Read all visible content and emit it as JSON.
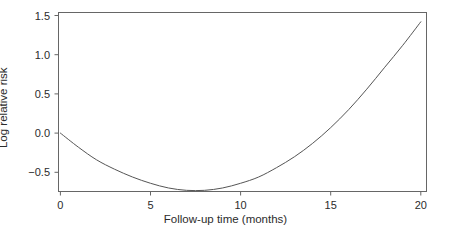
{
  "chart_data": {
    "type": "line",
    "title": "",
    "xlabel": "Follow-up time (months)",
    "ylabel": "Log relative risk",
    "xlim": [
      -0.8,
      21.0
    ],
    "ylim": [
      -0.82,
      1.58
    ],
    "xticks": [
      0,
      5,
      10,
      15,
      20
    ],
    "xtick_labels": [
      "0",
      "5",
      "10",
      "15",
      "20"
    ],
    "yticks": [
      -0.5,
      0.0,
      0.5,
      1.0,
      1.5
    ],
    "ytick_labels": [
      "−0.5",
      "0.0",
      "0.5",
      "1.0",
      "1.5"
    ],
    "grid": false,
    "legend": "none",
    "frame": "box",
    "line_color": "#555555",
    "line_width": 1,
    "series": [
      {
        "name": "Log relative risk",
        "x": [
          0,
          1,
          2,
          3,
          4,
          5,
          6,
          7,
          8,
          9,
          10,
          11,
          12,
          13,
          14,
          15,
          16,
          17,
          18,
          19,
          20
        ],
        "values": [
          0.0,
          -0.18,
          -0.34,
          -0.46,
          -0.56,
          -0.64,
          -0.7,
          -0.73,
          -0.73,
          -0.7,
          -0.64,
          -0.56,
          -0.44,
          -0.3,
          -0.13,
          0.07,
          0.3,
          0.56,
          0.84,
          1.12,
          1.42
        ]
      }
    ],
    "annotations": {
      "minimum_x": 7.2,
      "minimum_y": -0.73,
      "start_point": [
        0,
        0.0
      ],
      "end_point": [
        20,
        1.42
      ]
    }
  },
  "axes": {
    "x_title": "Follow-up time (months)",
    "y_title": "Log relative risk"
  }
}
